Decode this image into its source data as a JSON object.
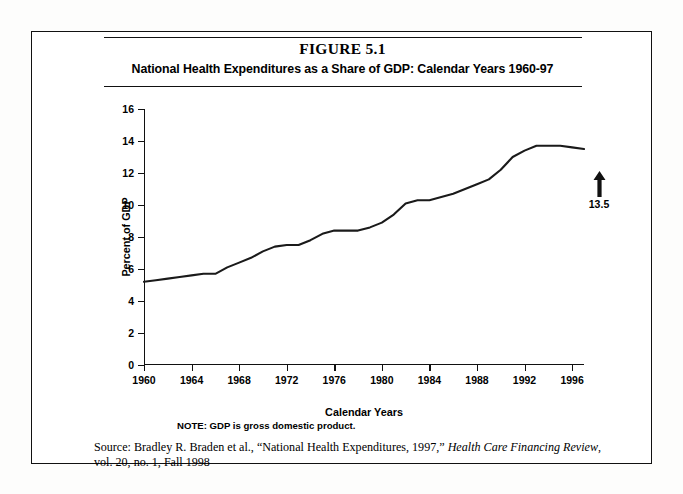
{
  "figure": {
    "number": "FIGURE 5.1",
    "subtitle": "National Health Expenditures as a Share of GDP: Calendar Years 1960-97",
    "note": "NOTE:  GDP is gross domestic product.",
    "source_prefix": "Source: Bradley R. Braden et al., “National Health Expenditures, 1997,” ",
    "source_italic": "Health Care Financing Review",
    "source_suffix": ",",
    "source_line2": "vol. 20, no. 1, Fall 1998"
  },
  "annotation": {
    "value_label": "13.5",
    "arrow_icon": "up-arrow-icon"
  },
  "colors": {
    "line": "#1a1a1a",
    "axis": "#111111",
    "frame": "#111111",
    "background": "#ffffff"
  },
  "chart_data": {
    "type": "line",
    "title": "National Health Expenditures as a Share of GDP: Calendar Years 1960-97",
    "xlabel": "Calendar Years",
    "ylabel": "Percent of GDP",
    "xlim": [
      1960,
      1997
    ],
    "ylim": [
      0,
      16
    ],
    "ytick_labels": [
      "0",
      "2",
      "4",
      "6",
      "8",
      "10",
      "12",
      "14",
      "16"
    ],
    "yticks": [
      0,
      2,
      4,
      6,
      8,
      10,
      12,
      14,
      16
    ],
    "xtick_labels": [
      "1960",
      "1964",
      "1968",
      "1972",
      "1976",
      "1980",
      "1984",
      "1988",
      "1992",
      "1996"
    ],
    "xticks": [
      1960,
      1964,
      1968,
      1972,
      1976,
      1980,
      1984,
      1988,
      1992,
      1996
    ],
    "grid": false,
    "legend": "none",
    "series": [
      {
        "name": "National Health Expenditures as % of GDP",
        "x": [
          1960,
          1961,
          1962,
          1963,
          1964,
          1965,
          1966,
          1967,
          1968,
          1969,
          1970,
          1971,
          1972,
          1973,
          1974,
          1975,
          1976,
          1977,
          1978,
          1979,
          1980,
          1981,
          1982,
          1983,
          1984,
          1985,
          1986,
          1987,
          1988,
          1989,
          1990,
          1991,
          1992,
          1993,
          1994,
          1995,
          1996,
          1997
        ],
        "values": [
          5.2,
          5.3,
          5.4,
          5.5,
          5.6,
          5.7,
          5.7,
          6.1,
          6.4,
          6.7,
          7.1,
          7.4,
          7.5,
          7.5,
          7.8,
          8.2,
          8.4,
          8.4,
          8.4,
          8.6,
          8.9,
          9.4,
          10.1,
          10.3,
          10.3,
          10.5,
          10.7,
          11.0,
          11.3,
          11.6,
          12.2,
          13.0,
          13.4,
          13.7,
          13.7,
          13.7,
          13.6,
          13.5
        ]
      }
    ],
    "annotations": [
      {
        "text": "13.5",
        "x": 1997,
        "y": 13.5,
        "type": "arrow-up"
      }
    ]
  }
}
